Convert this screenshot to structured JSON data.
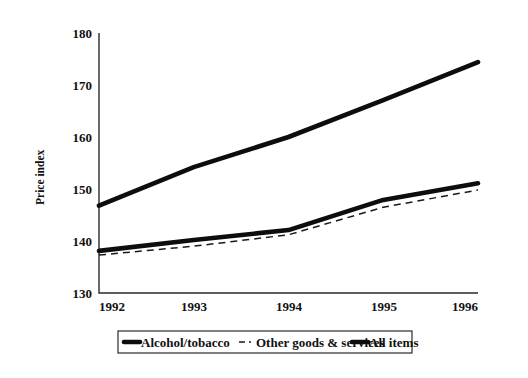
{
  "chart_data": {
    "type": "line",
    "title": "",
    "xlabel": "",
    "ylabel": "Price index",
    "categories": [
      "1992",
      "1993",
      "1994",
      "1995",
      "1996"
    ],
    "x": [
      1992,
      1993,
      1994,
      1995,
      1996
    ],
    "xlim": [
      1992,
      1996
    ],
    "ylim": [
      130,
      180
    ],
    "yticks": [
      130,
      140,
      150,
      160,
      170,
      180
    ],
    "ytick_labels": [
      "130",
      "140",
      "150",
      "160",
      "170",
      "180"
    ],
    "xticks": [
      1992,
      1993,
      1994,
      1995,
      1996
    ],
    "xtick_labels": [
      "1992",
      "1993",
      "1994",
      "1995",
      "1996"
    ],
    "grid": false,
    "legend_position": "bottom",
    "series": [
      {
        "name": "All items",
        "style": "solid-thick",
        "values": [
          146.8,
          154.2,
          160.0,
          167.1,
          174.4
        ]
      },
      {
        "name": "Alcohol/tobacco",
        "style": "solid-thick",
        "values": [
          138.1,
          140.2,
          142.1,
          147.9,
          151.1
        ]
      },
      {
        "name": "Other goods & services",
        "style": "dashed-thin",
        "values": [
          137.3,
          139.0,
          141.2,
          146.5,
          149.8
        ]
      }
    ],
    "legend_entries": [
      {
        "label": "Alcohol/tobacco",
        "marker": "solid-thick"
      },
      {
        "label": "Other goods & services",
        "marker": "dashed-thin"
      },
      {
        "label": "All items",
        "marker": "solid-thick"
      }
    ]
  }
}
